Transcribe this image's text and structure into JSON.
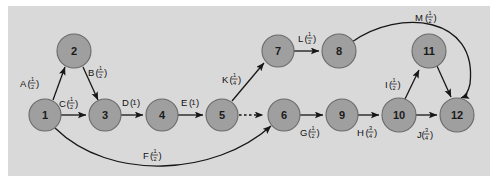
{
  "figure": {
    "kind": "directed-graph",
    "background_color": "#d9d9d9",
    "page_color": "#ffffff",
    "node_fill": "#9f9f9f",
    "node_stroke": "#6a6a6a",
    "edge_color": "#161616"
  },
  "nodes": [
    {
      "id": "n1",
      "label": "1",
      "cx": 45,
      "cy": 115,
      "r": 16
    },
    {
      "id": "n2",
      "label": "2",
      "cx": 74,
      "cy": 51,
      "r": 17
    },
    {
      "id": "n3",
      "label": "3",
      "cx": 105,
      "cy": 115,
      "r": 16
    },
    {
      "id": "n4",
      "label": "4",
      "cx": 162,
      "cy": 115,
      "r": 16
    },
    {
      "id": "n5",
      "label": "5",
      "cx": 222,
      "cy": 115,
      "r": 16
    },
    {
      "id": "n6",
      "label": "6",
      "cx": 284,
      "cy": 115,
      "r": 16
    },
    {
      "id": "n7",
      "label": "7",
      "cx": 278,
      "cy": 51,
      "r": 16
    },
    {
      "id": "n8",
      "label": "8",
      "cx": 339,
      "cy": 51,
      "r": 17
    },
    {
      "id": "n9",
      "label": "9",
      "cx": 342,
      "cy": 115,
      "r": 16
    },
    {
      "id": "n10",
      "label": "10",
      "cx": 399,
      "cy": 115,
      "r": 17
    },
    {
      "id": "n11",
      "label": "11",
      "cx": 429,
      "cy": 51,
      "r": 17
    },
    {
      "id": "n12",
      "label": "12",
      "cx": 457,
      "cy": 115,
      "r": 17
    }
  ],
  "edges": [
    {
      "id": "eA",
      "letter": "A",
      "weight_num": "1",
      "weight_den": "2",
      "from": "n1",
      "to": "n2",
      "style": "solid",
      "label_x": 31,
      "label_y": 83
    },
    {
      "id": "eB",
      "letter": "B",
      "weight_num": "1",
      "weight_den": "2",
      "from": "n2",
      "to": "n3",
      "style": "solid",
      "label_x": 94,
      "label_y": 72
    },
    {
      "id": "eC",
      "letter": "C",
      "weight_num": "1",
      "weight_den": "2",
      "from": "n1",
      "to": "n3",
      "style": "solid",
      "label_x": 65,
      "label_y": 103
    },
    {
      "id": "eD",
      "letter": "D",
      "weight_whole": "1",
      "from": "n3",
      "to": "n4",
      "style": "solid",
      "label_x": 128,
      "label_y": 102
    },
    {
      "id": "eE",
      "letter": "E",
      "weight_whole": "1",
      "from": "n4",
      "to": "n5",
      "style": "solid",
      "label_x": 187,
      "label_y": 102
    },
    {
      "id": "eF",
      "letter": "F",
      "weight_num": "1",
      "weight_den": "2",
      "from": "n1",
      "to": "n6",
      "style": "solid",
      "label_x": 149,
      "label_y": 155
    },
    {
      "id": "eK",
      "letter": "K",
      "weight_num": "1",
      "weight_den": "4",
      "from": "n5",
      "to": "n7",
      "style": "solid",
      "label_x": 228,
      "label_y": 79
    },
    {
      "id": "eL",
      "letter": "L",
      "weight_num": "1",
      "weight_den": "2",
      "from": "n7",
      "to": "n8",
      "style": "solid",
      "label_x": 303,
      "label_y": 38
    },
    {
      "id": "e56",
      "letter": "",
      "from": "n5",
      "to": "n6",
      "style": "dashed",
      "label_x": 0,
      "label_y": 0
    },
    {
      "id": "eG",
      "letter": "G",
      "weight_num": "1",
      "weight_den": "2",
      "from": "n6",
      "to": "n9",
      "style": "solid",
      "label_x": 307,
      "label_y": 132
    },
    {
      "id": "eH",
      "letter": "H",
      "weight_num": "3",
      "weight_den": "4",
      "from": "n9",
      "to": "n10",
      "style": "solid",
      "label_x": 365,
      "label_y": 132
    },
    {
      "id": "eI",
      "letter": "I",
      "weight_num": "1",
      "weight_den": "2",
      "from": "n10",
      "to": "n11",
      "style": "solid",
      "label_x": 396,
      "label_y": 84
    },
    {
      "id": "eJ",
      "letter": "J",
      "weight_num": "3",
      "weight_den": "4",
      "from": "n10",
      "to": "n12",
      "style": "solid",
      "label_x": 423,
      "label_y": 134
    },
    {
      "id": "eM",
      "letter": "M",
      "weight_num": "1",
      "weight_den": "2",
      "from": "n8",
      "to": "n12",
      "style": "solid",
      "label_x": 422,
      "label_y": 17
    },
    {
      "id": "e1112",
      "letter": "",
      "from": "n11",
      "to": "n12",
      "style": "solid",
      "label_x": 0,
      "label_y": 0
    }
  ]
}
